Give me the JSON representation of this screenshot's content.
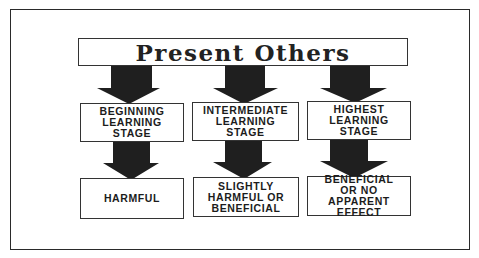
{
  "diagram": {
    "title": "Present Others",
    "stages": [
      {
        "label": "BEGINNING\nLEARNING\nSTAGE",
        "outcome": "HARMFUL"
      },
      {
        "label": "INTERMEDIATE\nLEARNING\nSTAGE",
        "outcome": "SLIGHTLY\nHARMFUL OR\nBENEFICIAL"
      },
      {
        "label": "HIGHEST\nLEARNING\nSTAGE",
        "outcome": "BENEFICIAL\nOR NO APPARENT\nEFFECT"
      }
    ],
    "colors": {
      "arrow": "#1f1f1f",
      "border": "#333333",
      "background": "#ffffff"
    }
  }
}
